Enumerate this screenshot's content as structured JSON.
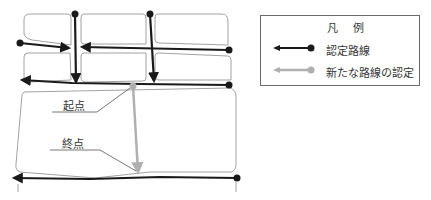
{
  "legend": {
    "title": "凡 例",
    "items": [
      {
        "label": "認定路線",
        "color": "#1a1a1a",
        "style": "solid-black-arrow-with-dot"
      },
      {
        "label": "新たな路線の認定",
        "color": "#b0b0b0",
        "style": "solid-gray-arrow-with-dot"
      }
    ]
  },
  "callouts": {
    "start_label": "起点",
    "end_label": "終点"
  },
  "colors": {
    "certified_route": "#1a1a1a",
    "new_route": "#b0b0b0",
    "block_outline": "#8a8a8a"
  }
}
